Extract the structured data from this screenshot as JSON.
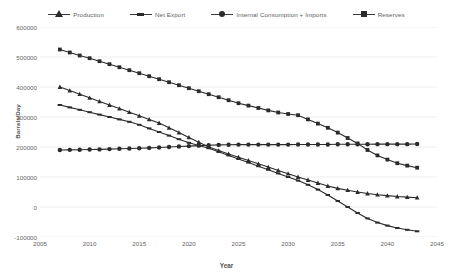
{
  "chart_data": {
    "type": "line",
    "title": "",
    "xlabel": "Year",
    "ylabel": "Barrels/Day",
    "xlim": [
      2005,
      2045
    ],
    "ylim": [
      -100000,
      600000
    ],
    "grid": true,
    "legend_position": "top-center",
    "ytick_labels": [
      "600000",
      "500000",
      "400000",
      "300000",
      "200000",
      "100000",
      "0",
      "-100000"
    ],
    "ytick_values": [
      600000,
      500000,
      400000,
      300000,
      200000,
      100000,
      0,
      -100000
    ],
    "xtick_labels": [
      "2005",
      "2010",
      "2015",
      "2020",
      "2025",
      "2030",
      "2035",
      "2040",
      "2045"
    ],
    "xtick_values": [
      2005,
      2010,
      2015,
      2020,
      2025,
      2030,
      2035,
      2040,
      2045
    ],
    "x": [
      2007,
      2008,
      2009,
      2010,
      2011,
      2012,
      2013,
      2014,
      2015,
      2016,
      2017,
      2018,
      2019,
      2020,
      2021,
      2022,
      2023,
      2024,
      2025,
      2026,
      2027,
      2028,
      2029,
      2030,
      2031,
      2032,
      2033,
      2034,
      2035,
      2036,
      2037,
      2038,
      2039,
      2040,
      2041,
      2042,
      2043
    ],
    "series": [
      {
        "name": "Production",
        "marker": "triangle",
        "color": "#2b2b2b",
        "values": [
          400000,
          388000,
          376000,
          364000,
          352000,
          340000,
          328000,
          316000,
          304000,
          292000,
          280000,
          264000,
          248000,
          232000,
          216000,
          200000,
          188000,
          177000,
          166000,
          155000,
          144000,
          133000,
          122000,
          111000,
          100000,
          90000,
          80000,
          70000,
          62000,
          56000,
          50000,
          45000,
          41000,
          38000,
          35000,
          33000,
          31000
        ]
      },
      {
        "name": "Net Export",
        "marker": "dash",
        "color": "#2b2b2b",
        "values": [
          340000,
          332000,
          324000,
          316000,
          308000,
          300000,
          292000,
          284000,
          274000,
          262000,
          250000,
          238000,
          226000,
          214000,
          205000,
          196000,
          184000,
          172000,
          160000,
          148000,
          136000,
          124000,
          112000,
          100000,
          88000,
          74000,
          58000,
          40000,
          20000,
          0,
          -20000,
          -38000,
          -52000,
          -62000,
          -70000,
          -76000,
          -81000
        ]
      },
      {
        "name": "Internal Consumption + Imports",
        "marker": "circle",
        "color": "#2b2b2b",
        "values": [
          190000,
          190500,
          191000,
          191500,
          192000,
          193000,
          194000,
          195000,
          196000,
          197000,
          198500,
          200000,
          201500,
          203000,
          204500,
          206000,
          207000,
          207500,
          208000,
          208000,
          208000,
          208000,
          208000,
          208000,
          208500,
          208500,
          208500,
          208500,
          209000,
          209000,
          209000,
          209000,
          209500,
          209500,
          209500,
          209500,
          210000
        ]
      },
      {
        "name": "Reserves",
        "marker": "square",
        "color": "#2b2b2b",
        "values": [
          525000,
          515000,
          505000,
          496000,
          486000,
          476000,
          466000,
          456000,
          446000,
          436000,
          426000,
          416000,
          406000,
          396000,
          386000,
          376000,
          366000,
          356000,
          346000,
          338000,
          330000,
          322000,
          315000,
          310000,
          306000,
          292000,
          278000,
          264000,
          248000,
          230000,
          212000,
          190000,
          172000,
          158000,
          146000,
          138000,
          131000
        ]
      }
    ]
  },
  "legend": {
    "items": [
      {
        "label": "Production",
        "marker": "tri"
      },
      {
        "label": "Net Export",
        "marker": "dash"
      },
      {
        "label": "Internal Consumption + Imports",
        "marker": "dot"
      },
      {
        "label": "Reserves",
        "marker": "sq"
      }
    ]
  }
}
